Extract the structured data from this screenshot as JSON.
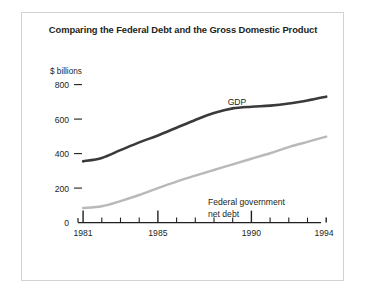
{
  "figure": {
    "title": "Comparing the Federal Debt and the Gross Domestic Product",
    "frame_color": "#d2d2d2",
    "background": "#ffffff"
  },
  "axes": {
    "y_unit_label": "$ billions",
    "y_ticks": [
      "800",
      "600",
      "400",
      "200",
      "0"
    ],
    "x_ticks": [
      "1981",
      "1985",
      "1990",
      "1994"
    ]
  },
  "series_labels": {
    "gdp": "GDP",
    "debt_line1": "Federal government",
    "debt_line2": "net debt"
  },
  "chart_data": {
    "type": "line",
    "title": "Comparing the Federal Debt and the Gross Domestic Product",
    "xlabel": "",
    "ylabel": "$ billions",
    "xlim": [
      1981,
      1994
    ],
    "ylim": [
      0,
      800
    ],
    "yticks": [
      0,
      200,
      400,
      600,
      800
    ],
    "xticks_major": [
      1981,
      1985,
      1990,
      1994
    ],
    "xticks_minor": [
      1982,
      1983,
      1984,
      1986,
      1987,
      1988,
      1989,
      1991,
      1992,
      1993
    ],
    "grid": false,
    "legend": "inline-annotations",
    "x": [
      1981,
      1982,
      1983,
      1984,
      1985,
      1986,
      1987,
      1988,
      1989,
      1990,
      1991,
      1992,
      1993,
      1994
    ],
    "series": [
      {
        "name": "GDP",
        "color": "#3a3a3a",
        "linewidth": 2.6,
        "values": [
          355,
          375,
          420,
          465,
          505,
          550,
          595,
          635,
          662,
          672,
          678,
          690,
          708,
          730
        ]
      },
      {
        "name": "Federal government net debt",
        "color": "#b9b9b9",
        "linewidth": 2.4,
        "values": [
          85,
          95,
          125,
          160,
          200,
          238,
          272,
          305,
          338,
          370,
          402,
          438,
          468,
          498
        ]
      }
    ]
  }
}
